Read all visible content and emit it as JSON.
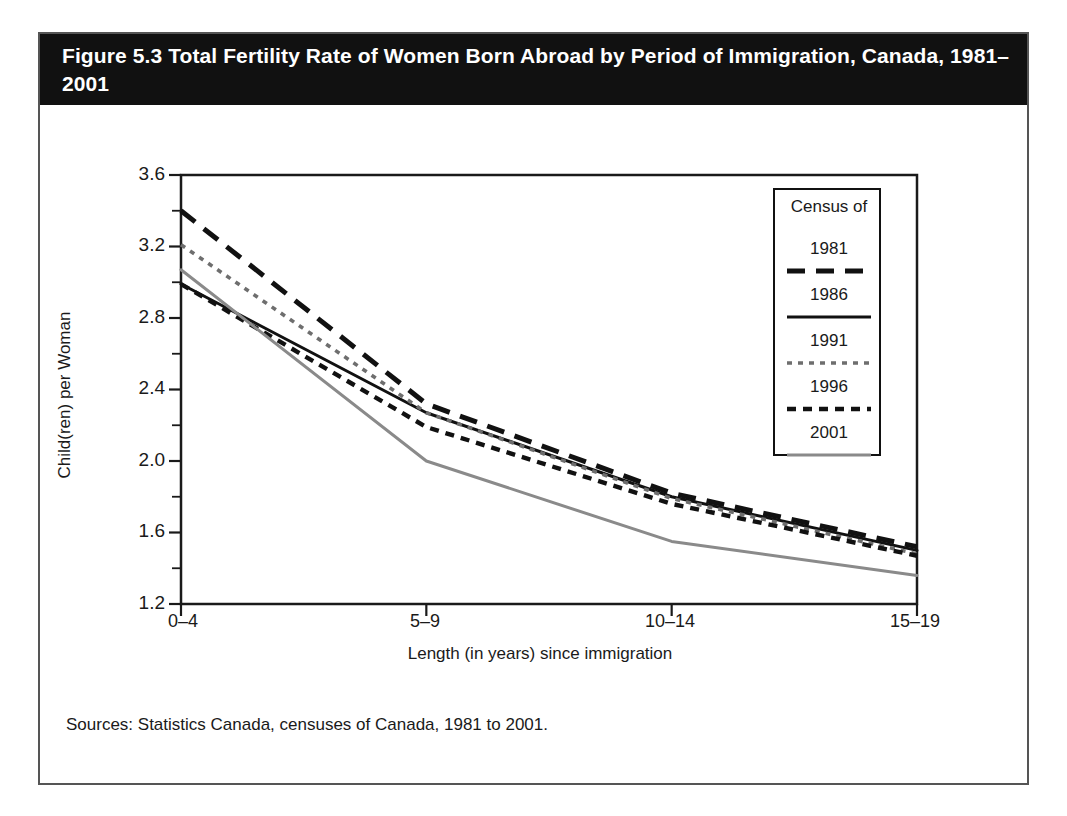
{
  "figure": {
    "title": "Figure 5.3 Total Fertility Rate of Women Born Abroad by Period of Immigration, Canada, 1981–2001",
    "sources": "Sources: Statistics Canada, censuses of Canada, 1981 to 2001."
  },
  "legend": {
    "title": "Census of",
    "entries": [
      {
        "label": "1981",
        "style": "long-dash",
        "color": "#111111"
      },
      {
        "label": "1986",
        "style": "solid",
        "color": "#111111"
      },
      {
        "label": "1991",
        "style": "fine-dot",
        "color": "#6e6e6e"
      },
      {
        "label": "1996",
        "style": "dash",
        "color": "#111111"
      },
      {
        "label": "2001",
        "style": "solid",
        "color": "#8a8a8a"
      }
    ]
  },
  "axes": {
    "y_ticks": [
      "3.6",
      "3.2",
      "2.8",
      "2.4",
      "2.0",
      "1.6",
      "1.2"
    ],
    "x_ticks": [
      "0–4",
      "5–9",
      "10–14",
      "15–19"
    ]
  },
  "chart_data": {
    "type": "line",
    "title": "Figure 5.3 Total Fertility Rate of Women Born Abroad by Period of Immigration, Canada, 1981–2001",
    "xlabel": "Length (in years) since immigration",
    "ylabel": "Child(ren) per Woman",
    "categories": [
      "0–4",
      "5–9",
      "10–14",
      "15–19"
    ],
    "ylim": [
      1.2,
      3.6
    ],
    "ytick_step": 0.4,
    "yminor_step": 0.2,
    "grid": false,
    "legend_position": "inside-top-right",
    "legend_title": "Census of",
    "series": [
      {
        "name": "1981",
        "values": [
          3.4,
          2.32,
          1.82,
          1.52
        ],
        "color": "#111111",
        "style": "long-dash"
      },
      {
        "name": "1986",
        "values": [
          2.99,
          2.27,
          1.8,
          1.5
        ],
        "color": "#111111",
        "style": "solid"
      },
      {
        "name": "1991",
        "values": [
          3.21,
          2.27,
          1.79,
          1.48
        ],
        "color": "#6e6e6e",
        "style": "fine-dot"
      },
      {
        "name": "1996",
        "values": [
          2.99,
          2.19,
          1.76,
          1.47
        ],
        "color": "#111111",
        "style": "dash"
      },
      {
        "name": "2001",
        "values": [
          3.07,
          2.0,
          1.55,
          1.36
        ],
        "color": "#8a8a8a",
        "style": "solid"
      }
    ]
  },
  "colors": {
    "frame": "#555555",
    "title_bar": "#111111",
    "title_text": "#ffffff",
    "axis": "#1a1a1a"
  }
}
